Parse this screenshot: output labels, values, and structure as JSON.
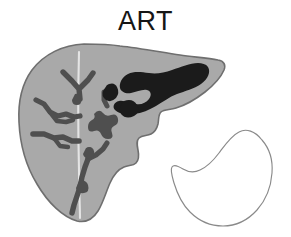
{
  "figure": {
    "title": "ART",
    "caption_text": "ART",
    "background_color": "#ffffff"
  },
  "colors": {
    "parenchyma_fill": "#a9a9a9",
    "parenchyma_stroke": "#6f6f6f",
    "vessel_fill": "#4f4f4f",
    "lesion_fill": "#1b1b1b",
    "ligament_line": "#e2e2e2",
    "spleen_fill": "#ffffff",
    "spleen_stroke": "#8a8a8a",
    "title_color": "#161616"
  },
  "organs": [
    {
      "name": "liver",
      "label": "liver-organ",
      "fill": "#a9a9a9",
      "stroke": "#6f6f6f",
      "filled": true,
      "bbox": [
        18,
        41,
        224,
        222
      ]
    },
    {
      "name": "spleen",
      "label": "spleen-organ",
      "fill": "#ffffff",
      "stroke": "#8a8a8a",
      "filled": false,
      "bbox": [
        171,
        129,
        273,
        226
      ]
    }
  ],
  "features": [
    {
      "name": "falciform-ligament",
      "type": "line",
      "color": "#e2e2e2"
    },
    {
      "name": "vascular-tree-left-upper",
      "type": "vessel",
      "color": "#4f4f4f"
    },
    {
      "name": "vascular-tree-left-mid",
      "type": "vessel",
      "color": "#4f4f4f"
    },
    {
      "name": "vascular-tree-left-lower",
      "type": "vessel",
      "color": "#4f4f4f"
    },
    {
      "name": "vascular-tree-central",
      "type": "vessel",
      "color": "#4f4f4f"
    },
    {
      "name": "vascular-tree-inferior",
      "type": "vessel",
      "color": "#4f4f4f"
    },
    {
      "name": "tumor-lesion-superior-right",
      "type": "lesion",
      "color": "#1b1b1b"
    }
  ]
}
